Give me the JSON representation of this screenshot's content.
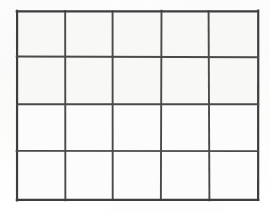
{
  "figure": {
    "kind": "grid-table",
    "columns": 5,
    "rows": 4,
    "total_cells": 20,
    "cell_text": ""
  },
  "canvas": {
    "width": 270,
    "height": 212,
    "background_color": "#fdfdfc"
  },
  "grid": {
    "left": 17,
    "top": 11,
    "right": 258,
    "bottom": 200,
    "width": 241,
    "height": 189,
    "line_color": "#4a4a4a",
    "outer_line_color": "#3e3e3e",
    "cell_fill_color": "#f8f8f7",
    "outer_stroke_width": 2.2,
    "inner_stroke_width": 1.9,
    "column_edges": [
      17,
      65,
      113,
      161,
      209,
      258
    ],
    "row_edges": [
      11,
      57,
      104,
      151,
      200
    ],
    "column_widths": [
      48,
      48,
      48,
      48,
      49
    ],
    "row_heights": [
      46,
      47,
      47,
      49
    ],
    "cells": [
      [
        "",
        "",
        "",
        "",
        ""
      ],
      [
        "",
        "",
        "",
        "",
        ""
      ],
      [
        "",
        "",
        "",
        "",
        ""
      ],
      [
        "",
        "",
        "",
        "",
        ""
      ]
    ]
  }
}
